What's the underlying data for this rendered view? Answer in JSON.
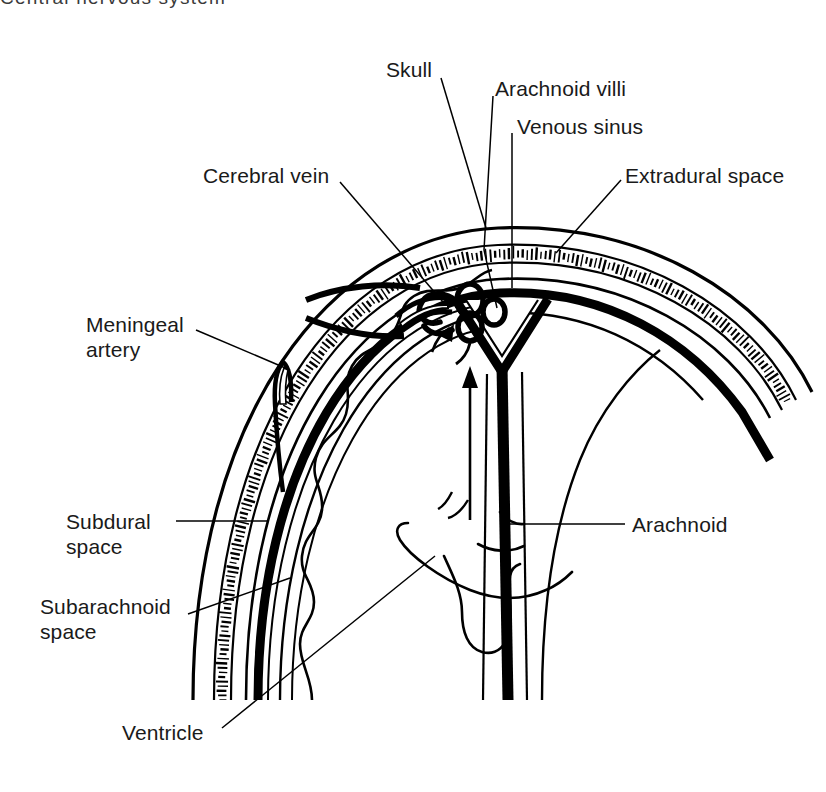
{
  "figure": {
    "title_clipped": "Central nervous system"
  },
  "colors": {
    "ink": "#000000",
    "text": "#1a1a1a",
    "background": "#ffffff"
  },
  "labels": [
    {
      "id": "skull",
      "text": "Skull",
      "x": 386,
      "y": 57,
      "align": "left"
    },
    {
      "id": "arachnoid-villi",
      "text": "Arachnoid villi",
      "x": 495,
      "y": 76,
      "align": "left"
    },
    {
      "id": "venous-sinus",
      "text": "Venous sinus",
      "x": 517,
      "y": 114,
      "align": "left"
    },
    {
      "id": "cerebral-vein",
      "text": "Cerebral vein",
      "x": 203,
      "y": 163,
      "align": "left"
    },
    {
      "id": "extradural-space",
      "text": "Extradural space",
      "x": 625,
      "y": 163,
      "align": "left"
    },
    {
      "id": "meningeal-artery",
      "text": "Meningeal\nartery",
      "x": 86,
      "y": 312,
      "align": "left"
    },
    {
      "id": "subdural-space",
      "text": "Subdural\nspace",
      "x": 66,
      "y": 509,
      "align": "left"
    },
    {
      "id": "arachnoid",
      "text": "Arachnoid",
      "x": 632,
      "y": 512,
      "align": "left"
    },
    {
      "id": "subarachnoid-space",
      "text": "Subarachnoid\nspace",
      "x": 40,
      "y": 594,
      "align": "left"
    },
    {
      "id": "ventricle",
      "text": "Ventricle",
      "x": 122,
      "y": 720,
      "align": "left"
    }
  ],
  "leader_lines": [
    {
      "id": "leader-skull",
      "points": "441,78 486,228"
    },
    {
      "id": "leader-arachnoid-villi",
      "points": "493,96 484,250 497,308"
    },
    {
      "id": "leader-venous-sinus",
      "points": "512,133 512,288"
    },
    {
      "id": "leader-cerebral-vein",
      "points": "340,182 443,302"
    },
    {
      "id": "leader-extradural-space",
      "points": "621,180 556,253"
    },
    {
      "id": "leader-meningeal-artery",
      "points": "196,330 290,370"
    },
    {
      "id": "leader-subdural-space",
      "points": "176,521 268,521"
    },
    {
      "id": "leader-arachnoid",
      "points": "625,524 510,524"
    },
    {
      "id": "leader-subarachnoid",
      "points": "188,614 290,578"
    },
    {
      "id": "leader-ventricle",
      "points": "222,728 435,556"
    }
  ],
  "structures": [
    {
      "id": "skull-vault",
      "name": "Skull vault with diploe hatching"
    },
    {
      "id": "dura-mater",
      "name": "Dura mater (thick black band)"
    },
    {
      "id": "arachnoid-mater",
      "name": "Arachnoid mater"
    },
    {
      "id": "pia-brain-surface",
      "name": "Brain surface gyri (scalloped)"
    },
    {
      "id": "falx-cerebri",
      "name": "Falx cerebri"
    },
    {
      "id": "superior-sagittal-sinus",
      "name": "Superior sagittal sinus (triangular lumen)"
    },
    {
      "id": "arachnoid-villi-tuft",
      "name": "Arachnoid villi tuft"
    },
    {
      "id": "meningeal-artery-vessel",
      "name": "Middle meningeal artery"
    },
    {
      "id": "cerebral-vein-vessel",
      "name": "Bridging cerebral vein"
    },
    {
      "id": "lateral-ventricle",
      "name": "Lateral ventricle outline"
    },
    {
      "id": "csf-flow-arrow",
      "name": "CSF flow arrow"
    }
  ]
}
